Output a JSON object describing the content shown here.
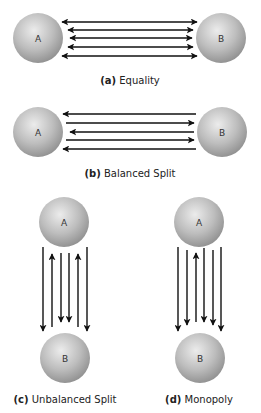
{
  "panels": [
    {
      "id": "a",
      "tag": "(a)",
      "title": "Equality",
      "caption_pos": [
        130,
        75
      ],
      "orientation": "horizontal",
      "nodes": [
        {
          "label": "A",
          "cx": 38,
          "cy": 38,
          "r": 25
        },
        {
          "label": "B",
          "cx": 221,
          "cy": 38,
          "r": 25
        }
      ],
      "arrows": [
        {
          "y": 22,
          "x1": 62,
          "x2": 197,
          "dir": "both"
        },
        {
          "y": 30,
          "x1": 68,
          "x2": 193,
          "dir": "both"
        },
        {
          "y": 38,
          "x1": 70,
          "x2": 192,
          "dir": "both"
        },
        {
          "y": 47,
          "x1": 68,
          "x2": 193,
          "dir": "both"
        },
        {
          "y": 56,
          "x1": 62,
          "x2": 197,
          "dir": "both"
        }
      ]
    },
    {
      "id": "b",
      "tag": "(b)",
      "title": "Balanced Split",
      "caption_pos": [
        130,
        168
      ],
      "orientation": "horizontal",
      "nodes": [
        {
          "label": "A",
          "cx": 38,
          "cy": 132,
          "r": 25
        },
        {
          "label": "B",
          "cx": 222,
          "cy": 132,
          "r": 25
        }
      ],
      "arrows": [
        {
          "y": 114,
          "x1": 63,
          "x2": 196,
          "dir": "to-A"
        },
        {
          "y": 123,
          "x1": 66,
          "x2": 194,
          "dir": "to-B"
        },
        {
          "y": 132,
          "x1": 70,
          "x2": 194,
          "dir": "to-A"
        },
        {
          "y": 140,
          "x1": 66,
          "x2": 194,
          "dir": "to-B"
        },
        {
          "y": 149,
          "x1": 63,
          "x2": 196,
          "dir": "to-A"
        }
      ]
    },
    {
      "id": "c",
      "tag": "(c)",
      "title": "Unbalanced Split",
      "caption_pos": [
        65,
        394
      ],
      "orientation": "vertical",
      "nodes": [
        {
          "label": "A",
          "cx": 64,
          "cy": 222,
          "r": 25
        },
        {
          "label": "B",
          "cx": 65,
          "cy": 358,
          "r": 25
        }
      ],
      "arrows": [
        {
          "x": 43,
          "y1": 247,
          "y2": 331,
          "dir": "to-B"
        },
        {
          "x": 52,
          "y1": 254,
          "y2": 327,
          "dir": "to-A"
        },
        {
          "x": 61,
          "y1": 253,
          "y2": 322,
          "dir": "to-B"
        },
        {
          "x": 69,
          "y1": 253,
          "y2": 322,
          "dir": "to-B"
        },
        {
          "x": 78,
          "y1": 254,
          "y2": 327,
          "dir": "to-A"
        },
        {
          "x": 87,
          "y1": 247,
          "y2": 331,
          "dir": "to-B"
        }
      ]
    },
    {
      "id": "d",
      "tag": "(d)",
      "title": "Monopoly",
      "caption_pos": [
        199,
        394
      ],
      "orientation": "vertical",
      "nodes": [
        {
          "label": "A",
          "cx": 199,
          "cy": 222,
          "r": 25
        },
        {
          "label": "B",
          "cx": 200,
          "cy": 358,
          "r": 25
        }
      ],
      "arrows": [
        {
          "x": 178,
          "y1": 247,
          "y2": 331,
          "dir": "to-B"
        },
        {
          "x": 187,
          "y1": 250,
          "y2": 325,
          "dir": "to-B"
        },
        {
          "x": 196,
          "y1": 253,
          "y2": 322,
          "dir": "to-A"
        },
        {
          "x": 204,
          "y1": 248,
          "y2": 322,
          "dir": "to-B"
        },
        {
          "x": 213,
          "y1": 250,
          "y2": 325,
          "dir": "to-B"
        },
        {
          "x": 221,
          "y1": 247,
          "y2": 331,
          "dir": "to-B"
        }
      ]
    }
  ],
  "colors": {
    "arrow": "#111111",
    "sphere_light": "#e6e6e6",
    "sphere_mid": "#b8b8b8",
    "sphere_dark": "#8a8a8a",
    "label": "#333333"
  }
}
